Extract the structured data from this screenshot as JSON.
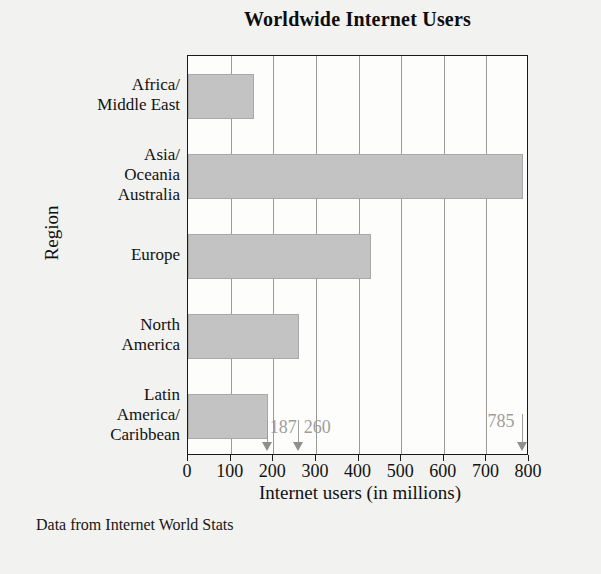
{
  "figure": {
    "title": "Worldwide Internet Users",
    "footnote": "Data from Internet World Stats",
    "bar_color": "#c3c3c3",
    "bar_edge_color": "#a8a8a8",
    "frame_color": "#1a1a1a",
    "gridline_color": "#9a9a9a",
    "annotation_color": "#9d9d9d",
    "background_color": "#f2f2f0"
  },
  "chart_data": {
    "type": "bar",
    "orientation": "horizontal",
    "title": "Worldwide Internet Users",
    "xlabel": "Internet users (in millions)",
    "ylabel": "Region",
    "categories": [
      "Africa/\nMiddle East",
      "Asia/\nOceania\nAustralia",
      "Europe",
      "North\nAmerica",
      "Latin\nAmerica/\nCaribbean"
    ],
    "values": [
      155,
      785,
      430,
      260,
      187
    ],
    "xlim": [
      0,
      800
    ],
    "xticks": [
      0,
      100,
      200,
      300,
      400,
      500,
      600,
      700,
      800
    ],
    "xticklabels": [
      "0",
      "100",
      "200",
      "300",
      "400",
      "500",
      "600",
      "700",
      "800"
    ],
    "grid": "vertical",
    "legend": null,
    "annotations": [
      {
        "label": "187",
        "value": 187,
        "target_category": "Latin America/Caribbean"
      },
      {
        "label": "260",
        "value": 260,
        "target_category": "North America"
      },
      {
        "label": "785",
        "value": 785,
        "target_category": "Asia/Oceania Australia"
      }
    ]
  },
  "axis": {
    "y_title": "Region",
    "x_title": "Internet users (in millions)",
    "categories": [
      {
        "lines": [
          "Africa/",
          "Middle East"
        ]
      },
      {
        "lines": [
          "Asia/",
          "Oceania",
          "Australia"
        ]
      },
      {
        "lines": [
          "Europe"
        ]
      },
      {
        "lines": [
          "North",
          "America"
        ]
      },
      {
        "lines": [
          "Latin",
          "America/",
          "Caribbean"
        ]
      }
    ]
  }
}
